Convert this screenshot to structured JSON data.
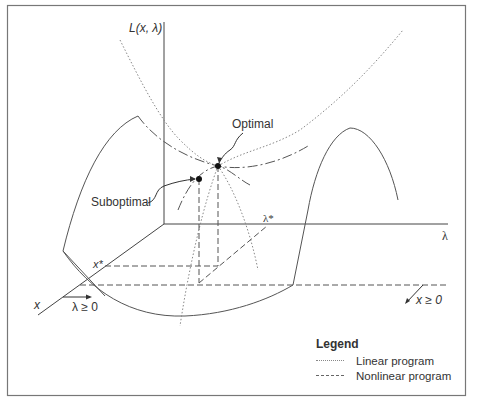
{
  "figure": {
    "axis_labels": {
      "vertical": "L(x, λ)",
      "lambda_axis": "λ",
      "x_axis": "x",
      "x_star": "x*",
      "lambda_star": "λ*"
    },
    "constraints": {
      "lambda_nonneg": "λ ≥ 0",
      "x_nonneg": "x ≥ 0"
    },
    "annotations": {
      "optimal": "Optimal",
      "suboptimal": "Suboptimal"
    },
    "legend": {
      "title": "Legend",
      "items": [
        {
          "label": "Linear program",
          "style": "dotted"
        },
        {
          "label": "Nonlinear program",
          "style": "dashed"
        }
      ]
    },
    "colors": {
      "line": "#555555",
      "dotted": "#888888",
      "border": "#777777"
    }
  }
}
